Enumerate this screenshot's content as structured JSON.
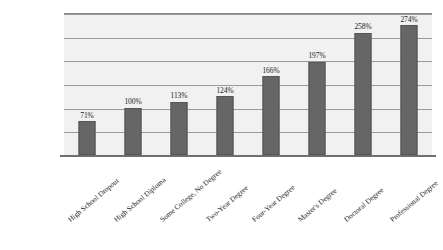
{
  "chart_data": {
    "type": "bar",
    "title": "",
    "subtitle": "",
    "xlabel": "",
    "ylabel": "",
    "categories": [
      "High School Dropout",
      "High School Diploma",
      "Some College, No Degree",
      "Two-Year Degree",
      "Four-Year Degree",
      "Master's Degree",
      "Doctoral Degree",
      "Professional Degree"
    ],
    "values": [
      71,
      100,
      113,
      124,
      166,
      197,
      258,
      274
    ],
    "value_labels": [
      "71%",
      "100%",
      "113%",
      "124%",
      "166%",
      "197%",
      "258%",
      "274%"
    ],
    "ylim": [
      0,
      300
    ],
    "y_tick_values": [
      0,
      50,
      100,
      150,
      200,
      250,
      300
    ],
    "y_tick_labels": [],
    "grid": true,
    "grid_orientation": "horizontal",
    "legend": false,
    "legend_position": "none",
    "bar_color": "#666666",
    "plot_background_color": "#f1f1f1",
    "gridline_color": "#9a9a9a",
    "axis_color": "#6f6f6f",
    "label_text_color": "#1c1c1c",
    "page_background_color": "#ffffff",
    "category_label_rotation_degrees": 40,
    "annotations": []
  }
}
